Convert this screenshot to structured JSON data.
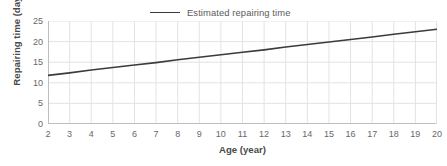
{
  "legend": {
    "position": "top-center",
    "entries": [
      {
        "label": "Estimated repairing time",
        "color": "#3b3b3b",
        "marker": "line"
      }
    ]
  },
  "axes": {
    "x_title": "Age (year)",
    "y_title": "Repairing time (day)"
  },
  "colors": {
    "line": "#3b3b3b",
    "gridline": "#e3e3e3",
    "axis": "#bfbfbf",
    "text": "#686868",
    "title_text": "#4a4a4a",
    "background": "#ffffff"
  },
  "chart_data": {
    "type": "line",
    "title": "",
    "subtitle": "",
    "xlabel": "Age (year)",
    "ylabel": "Repairing time (day)",
    "xlim": [
      2,
      20
    ],
    "ylim": [
      0,
      25
    ],
    "xticks": [
      2,
      3,
      4,
      5,
      6,
      7,
      8,
      9,
      10,
      11,
      12,
      13,
      14,
      15,
      16,
      17,
      18,
      19,
      20
    ],
    "yticks": [
      0,
      5,
      10,
      15,
      20,
      25
    ],
    "xtick_labels": [
      "2",
      "3",
      "4",
      "5",
      "6",
      "7",
      "8",
      "9",
      "10",
      "11",
      "12",
      "13",
      "14",
      "15",
      "16",
      "17",
      "18",
      "19",
      "20"
    ],
    "ytick_labels": [
      "0",
      "5",
      "10",
      "15",
      "20",
      "25"
    ],
    "grid": true,
    "grid_axis": "both",
    "legend_position": "top-center",
    "series": [
      {
        "name": "Estimated repairing time",
        "color": "#3b3b3b",
        "x": [
          2,
          3,
          4,
          5,
          6,
          7,
          8,
          9,
          10,
          11,
          12,
          13,
          14,
          15,
          16,
          17,
          18,
          19,
          20
        ],
        "values": [
          11.8,
          12.4,
          13.1,
          13.7,
          14.3,
          14.9,
          15.6,
          16.2,
          16.8,
          17.4,
          18.0,
          18.7,
          19.3,
          19.9,
          20.5,
          21.1,
          21.8,
          22.4,
          23.0
        ]
      }
    ],
    "annotations": []
  }
}
